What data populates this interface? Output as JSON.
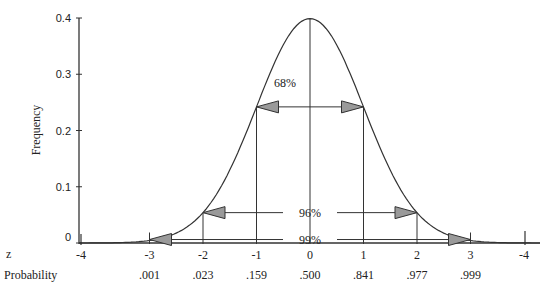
{
  "chart_data": {
    "type": "line",
    "title": "",
    "xlabel": "z",
    "ylabel": "Frequency",
    "second_xlabel": "Probability",
    "xlim": [
      -4,
      4
    ],
    "ylim": [
      0,
      0.4
    ],
    "grid": false,
    "y_ticks": [
      0,
      0.1,
      0.2,
      0.3,
      0.4
    ],
    "y_tick_labels": [
      "0",
      "0.1",
      "0.2",
      "0.3",
      "0.4"
    ],
    "x_ticks": [
      -4,
      -3,
      -2,
      -1,
      0,
      1,
      2,
      3,
      4
    ],
    "x_tick_labels": [
      "-4",
      "-3",
      "-2",
      "-1",
      "0",
      "1",
      "2",
      "3",
      "-4"
    ],
    "probability_labels": [
      ".001",
      ".023",
      ".159",
      ".500",
      ".841",
      ".977",
      ".999"
    ],
    "probability_positions": [
      -3,
      -2,
      -1,
      0,
      1,
      2,
      3
    ],
    "series": [
      {
        "name": "Normal distribution",
        "x": [
          -4,
          -3.5,
          -3,
          -2.5,
          -2,
          -1.5,
          -1,
          -0.5,
          0,
          0.5,
          1,
          1.5,
          2,
          2.5,
          3,
          3.5,
          4
        ],
        "values": [
          0.0001,
          0.0009,
          0.0044,
          0.0175,
          0.054,
          0.1295,
          0.242,
          0.3521,
          0.3989,
          0.3521,
          0.242,
          0.1295,
          0.054,
          0.0175,
          0.0044,
          0.0009,
          0.0001
        ]
      }
    ],
    "vertical_lines": [
      -3,
      -2,
      -1,
      0,
      1,
      2,
      3
    ],
    "annotations": [
      {
        "label": "68%",
        "from": -1,
        "to": 1,
        "y": 0.242
      },
      {
        "label": "96%",
        "from": -2,
        "to": 2,
        "y": 0.054
      },
      {
        "label": "99%",
        "from": -3,
        "to": 3,
        "y": 0.0044
      }
    ]
  }
}
